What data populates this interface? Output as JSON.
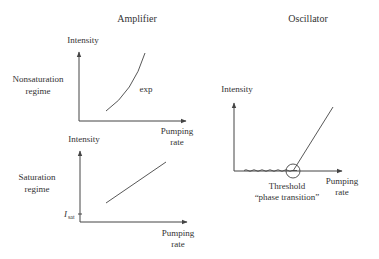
{
  "titles": {
    "amplifier": "Amplifier",
    "oscillator": "Oscillator"
  },
  "amplifier": {
    "nonsaturation": {
      "y_label": "Intensity",
      "regime_line1": "Nonsaturation",
      "regime_line2": "regime",
      "curve_label": "exp",
      "x_label_line1": "Pumping",
      "x_label_line2": "rate"
    },
    "saturation": {
      "y_label": "Intensity",
      "regime_line1": "Saturation",
      "regime_line2": "regime",
      "tick_label_main": "I",
      "tick_label_sub": "sat",
      "x_label_line1": "Pumping",
      "x_label_line2": "rate"
    }
  },
  "oscillator": {
    "y_label": "Intensity",
    "x_label_line1": "Pumping",
    "x_label_line2": "rate",
    "threshold_line1": "Threshold",
    "threshold_line2": "“phase transition”"
  },
  "colors": {
    "ink": "#444444",
    "text": "#333333",
    "background": "#ffffff"
  }
}
